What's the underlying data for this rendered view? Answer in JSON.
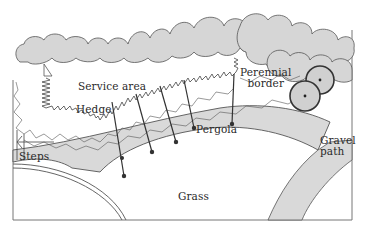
{
  "diagram": {
    "type": "garden-plan",
    "colors": {
      "fill_gray": "#d6d6d6",
      "fill_light": "#f2f2f2",
      "stroke": "#4a4a4a",
      "background": "#ffffff"
    },
    "labels": {
      "service_area": "Service area",
      "hedge": "Hedge",
      "perennial_border_line1": "Perennial",
      "perennial_border_line2": "border",
      "pergola": "Pergola",
      "gravel_path_line1": "Gravel",
      "gravel_path_line2": "path",
      "steps": "Steps",
      "grass": "Grass"
    }
  }
}
